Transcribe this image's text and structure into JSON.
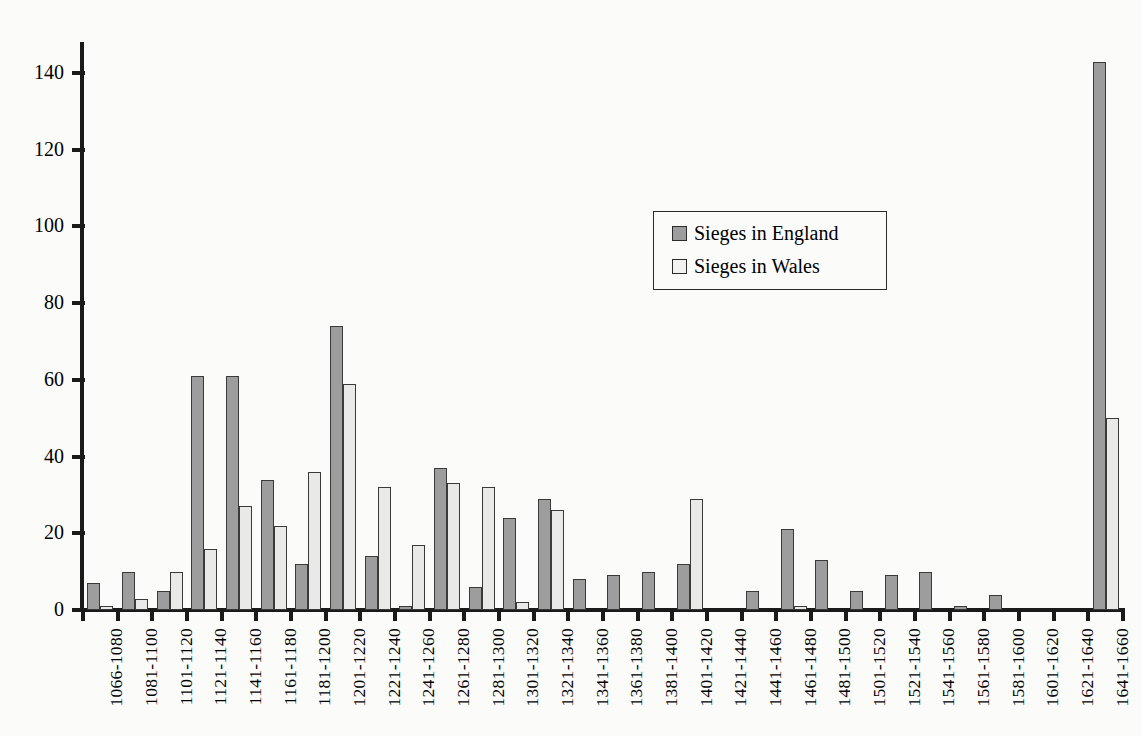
{
  "chart_data": {
    "type": "bar",
    "title": "",
    "xlabel": "",
    "ylabel": "",
    "ylim": [
      0,
      148
    ],
    "ytick_values": [
      0,
      20,
      40,
      60,
      80,
      100,
      120,
      140
    ],
    "ytick_labels": [
      "0",
      "20",
      "40",
      "60",
      "80",
      "100",
      "120",
      "140"
    ],
    "grid": false,
    "legend_position": "upper-center-right",
    "categories": [
      "1066-1080",
      "1081-1100",
      "1101-1120",
      "1121-1140",
      "1141-1160",
      "1161-1180",
      "1181-1200",
      "1201-1220",
      "1221-1240",
      "1241-1260",
      "1261-1280",
      "1281-1300",
      "1301-1320",
      "1321-1340",
      "1341-1360",
      "1361-1380",
      "1381-1400",
      "1401-1420",
      "1421-1440",
      "1441-1460",
      "1461-1480",
      "1481-1500",
      "1501-1520",
      "1521-1540",
      "1541-1560",
      "1561-1580",
      "1581-1600",
      "1601-1620",
      "1621-1640",
      "1641-1660"
    ],
    "series": [
      {
        "name": "Sieges in England",
        "color": "#9d9d9d",
        "values": [
          7,
          10,
          5,
          61,
          61,
          34,
          12,
          74,
          14,
          1,
          37,
          6,
          24,
          29,
          8,
          9,
          10,
          12,
          0,
          5,
          21,
          13,
          5,
          9,
          10,
          1,
          4,
          0,
          0,
          143
        ]
      },
      {
        "name": "Sieges in Wales",
        "color": "#e9e9e7",
        "values": [
          1,
          3,
          10,
          16,
          27,
          22,
          36,
          59,
          32,
          17,
          33,
          32,
          2,
          26,
          0,
          0,
          0,
          29,
          0,
          0,
          1,
          0,
          0,
          0,
          0,
          0,
          0,
          0,
          0,
          50
        ]
      }
    ]
  },
  "legend": {
    "items": [
      {
        "label": "Sieges in England",
        "color": "#9d9d9d"
      },
      {
        "label": "Sieges in Wales",
        "color": "#f2f2f0"
      }
    ]
  }
}
